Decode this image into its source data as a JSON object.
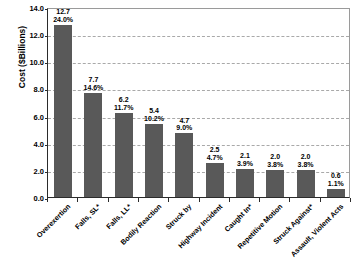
{
  "chart_data": {
    "type": "bar",
    "title": "",
    "xlabel": "",
    "ylabel": "Cost ($Billions)",
    "ylim": [
      0.0,
      14.0
    ],
    "ytick_step": 2.0,
    "ytick_labels": [
      "14.0",
      "12.0",
      "10.0",
      "8.0",
      "6.0",
      "4.0",
      "2.0",
      "0.0"
    ],
    "ytick_values": [
      14.0,
      12.0,
      10.0,
      8.0,
      6.0,
      4.0,
      2.0,
      0.0
    ],
    "grid": "horizontal-dashed",
    "legend": "none",
    "bar_color": "#595959",
    "categories": [
      "Overexertion",
      "Falls, SL*",
      "Falls, LL*",
      "Bodily Reaction",
      "Struck by",
      "Highway Incident",
      "Caught In*",
      "Repetitive Motion",
      "Struck Against*",
      "Assault, Violent Acts"
    ],
    "values": [
      12.7,
      7.7,
      6.2,
      5.4,
      4.7,
      2.5,
      2.1,
      2.0,
      2.0,
      0.6
    ],
    "value_labels": [
      "12.7",
      "7.7",
      "6.2",
      "5.4",
      "4.7",
      "2.5",
      "2.1",
      "2.0",
      "2.0",
      "0.6"
    ],
    "percent_labels": [
      "24.0%",
      "14.6%",
      "11.7%",
      "10.2%",
      "9.0%",
      "4.7%",
      "3.9%",
      "3.8%",
      "3.8%",
      "1.1%"
    ],
    "percents": [
      24.0,
      14.6,
      11.7,
      10.2,
      9.0,
      4.7,
      3.9,
      3.8,
      3.8,
      1.1
    ]
  }
}
